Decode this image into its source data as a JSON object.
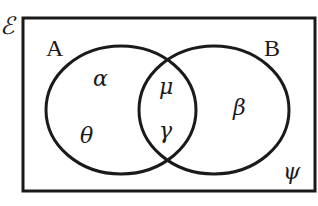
{
  "diagram": {
    "type": "venn",
    "universal_symbol": "ℰ",
    "sets": [
      {
        "name": "A"
      },
      {
        "name": "B"
      }
    ],
    "regions": {
      "a_only_top": "α",
      "a_only_bottom": "θ",
      "intersection_top": "μ",
      "intersection_bottom": "γ",
      "b_only": "β",
      "outside": "ψ"
    },
    "colors": {
      "stroke": "#1a1a1a",
      "background": "#ffffff"
    }
  }
}
